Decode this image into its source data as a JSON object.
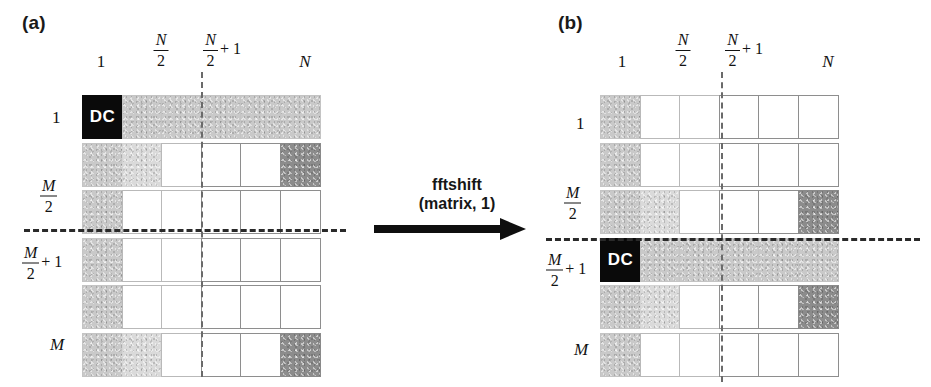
{
  "figure": {
    "panel_a_label": "(a)",
    "panel_b_label": "(b)",
    "operation_line1": "fftshift",
    "operation_line2": "(matrix, 1)",
    "dc_label": "DC"
  },
  "axis_labels": {
    "col_first": "1",
    "col_half_num": "N",
    "col_half_den": "2",
    "col_half_plus_num": "N",
    "col_half_plus_den": "2",
    "col_half_plus_suffix": "+ 1",
    "col_last": "N",
    "row_first": "1",
    "row_half_num": "M",
    "row_half_den": "2",
    "row_half_plus_num": "M",
    "row_half_plus_den": "2",
    "row_half_plus_suffix": "+ 1",
    "row_last": "M"
  },
  "colors": {
    "black": "#0a0a0a",
    "dark_gray": "#8c8c8c",
    "mid_gray": "#c9c9c9",
    "light_gray": "#dadada",
    "white": "#ffffff",
    "dash_line": "#2a2a2a"
  },
  "chart_data": {
    "type": "heatmap",
    "xlabel": "",
    "ylabel": "",
    "grid": true,
    "legend": "none",
    "rows": 6,
    "cols": 6,
    "row_ticks": {
      "1": "1",
      "3": "M/2",
      "4": "M/2 + 1",
      "6": "M"
    },
    "col_ticks": {
      "1": "1",
      "3": "N/2",
      "4": "N/2 + 1",
      "6": "N"
    },
    "split_after_row": 3,
    "split_after_col": 3,
    "shade_levels": {
      "black": 0,
      "dark": 0.45,
      "mid": 0.78,
      "light": 0.86,
      "white": 1.0
    },
    "panels": [
      {
        "name": "a",
        "label": "(a)",
        "caption": "Unshifted matrix: DC at (1,1)",
        "dc_cell": [
          1,
          1
        ],
        "values": [
          [
            "black",
            "mid",
            "mid",
            "mid",
            "mid",
            "mid"
          ],
          [
            "mid",
            "light",
            "white",
            "white",
            "white",
            "dark"
          ],
          [
            "mid",
            "white",
            "white",
            "white",
            "white",
            "white"
          ],
          [
            "mid",
            "white",
            "white",
            "white",
            "white",
            "white"
          ],
          [
            "mid",
            "white",
            "white",
            "white",
            "white",
            "white"
          ],
          [
            "mid",
            "light",
            "white",
            "white",
            "white",
            "dark"
          ]
        ]
      },
      {
        "name": "b",
        "label": "(b)",
        "caption": "After fftshift(matrix, 1): DC at (M/2 + 1, 1)",
        "dc_cell": [
          4,
          1
        ],
        "values": [
          [
            "mid",
            "white",
            "white",
            "white",
            "white",
            "white"
          ],
          [
            "mid",
            "white",
            "white",
            "white",
            "white",
            "white"
          ],
          [
            "mid",
            "light",
            "white",
            "white",
            "white",
            "dark"
          ],
          [
            "black",
            "mid",
            "mid",
            "mid",
            "mid",
            "mid"
          ],
          [
            "mid",
            "light",
            "white",
            "white",
            "white",
            "dark"
          ],
          [
            "mid",
            "white",
            "white",
            "white",
            "white",
            "white"
          ]
        ]
      }
    ]
  }
}
